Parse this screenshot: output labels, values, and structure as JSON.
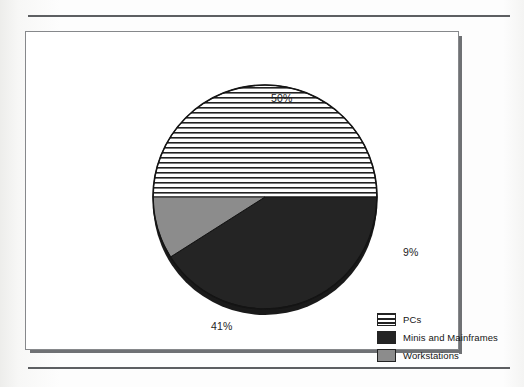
{
  "page": {
    "background_color": "#fbfbfa",
    "rule_color": "#5d5f62",
    "frame_border_color": "#86888b",
    "frame_shadow_color": "#6f7174"
  },
  "chart_data": {
    "type": "pie",
    "title": "",
    "subtitle": "",
    "xlabel": "",
    "ylabel": "",
    "grid": false,
    "legend_position": "bottom-right",
    "units": "percent",
    "total": 100,
    "categories": [
      "PCs",
      "Minis and Mainframes",
      "Workstations"
    ],
    "values": [
      50,
      41,
      9
    ],
    "data_labels": [
      "50%",
      "41%",
      "9%"
    ],
    "slices": [
      {
        "label": "PCs",
        "value": 50,
        "data_label": "50%",
        "fill": "horizontal-stripes",
        "fill_color": "#ffffff",
        "stripe_color": "#222222",
        "start_angle_deg": 270,
        "end_angle_deg": 90
      },
      {
        "label": "Minis and Mainframes",
        "value": 41,
        "data_label": "41%",
        "fill": "solid",
        "fill_color": "#242424",
        "start_angle_deg": 117.6,
        "end_angle_deg": 270
      },
      {
        "label": "Workstations",
        "value": 9,
        "data_label": "9%",
        "fill": "solid",
        "fill_color": "#8c8c8c",
        "start_angle_deg": 90,
        "end_angle_deg": 117.6
      }
    ]
  },
  "labels": {
    "pcs_pct": "50%",
    "workstations_pct": "9%",
    "minis_pct": "41%"
  },
  "legend": {
    "items": [
      {
        "label": "PCs",
        "swatch": "striped-swatch"
      },
      {
        "label": "Minis and Mainframes",
        "swatch": "dark-swatch"
      },
      {
        "label": "Workstations",
        "swatch": "gray-swatch"
      }
    ]
  }
}
